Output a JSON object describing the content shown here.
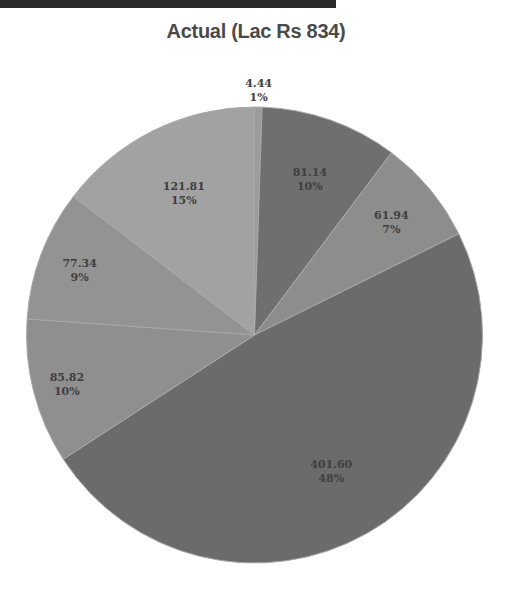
{
  "chart_data": {
    "type": "pie",
    "title": "Actual (Lac Rs 834)",
    "start": "top",
    "direction": "clockwise",
    "slices": [
      {
        "value": 4.44,
        "value_label": "4.44",
        "percent_label": "1%",
        "color": "#9c9c9c"
      },
      {
        "value": 81.14,
        "value_label": "81.14",
        "percent_label": "10%",
        "color": "#6f6f6f"
      },
      {
        "value": 61.94,
        "value_label": "61.94",
        "percent_label": "7%",
        "color": "#8d8d8d"
      },
      {
        "value": 401.6,
        "value_label": "401.60",
        "percent_label": "48%",
        "color": "#6b6b6b"
      },
      {
        "value": 85.82,
        "value_label": "85.82",
        "percent_label": "10%",
        "color": "#8f8f8f"
      },
      {
        "value": 77.34,
        "value_label": "77.34",
        "percent_label": "9%",
        "color": "#939393"
      },
      {
        "value": 121.81,
        "value_label": "121.81",
        "percent_label": "15%",
        "color": "#a2a2a2"
      }
    ],
    "legend": "none"
  }
}
